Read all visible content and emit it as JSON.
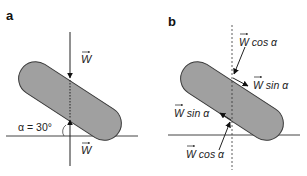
{
  "panels": [
    {
      "label": "a",
      "force_top": "W",
      "force_bottom": "W",
      "angle_label": "α = 30°"
    },
    {
      "label": "b",
      "component_top_normal": "W cos α",
      "component_top_parallel": "W sin α",
      "component_bottom_parallel": "W sin α",
      "component_bottom_normal": "W cos α"
    }
  ],
  "colors": {
    "shape_fill": "#a0a0a0",
    "shape_stroke": "#3a3a3a",
    "line": "#222222",
    "background": "#ffffff"
  }
}
